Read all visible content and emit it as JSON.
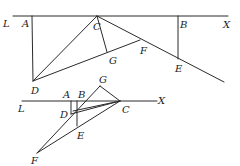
{
  "figure_top": {
    "labels": {
      "L": "L",
      "A": "A",
      "C": "C",
      "B": "B",
      "X": "X",
      "G": "G",
      "F": "F",
      "E": "E",
      "D": "D"
    }
  },
  "figure_bottom": {
    "labels": {
      "G": "G",
      "A": "A",
      "B": "B",
      "X": "X",
      "L": "L",
      "D": "D",
      "C": "C",
      "E": "E",
      "F": "F"
    }
  }
}
